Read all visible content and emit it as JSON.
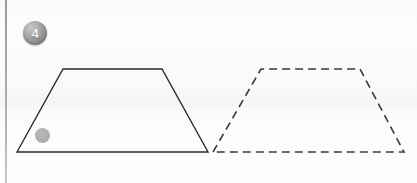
{
  "page": {
    "width": 417,
    "height": 183,
    "background_color": "#fdfdfd",
    "margin_rule_color": "#a9a9a9"
  },
  "question": {
    "number": "4",
    "badge_color": "#8e8e8e",
    "badge_text_color": "#f4f4f4"
  },
  "figure": {
    "stroke_color": "#2b2b2b",
    "stroke_width": 1.4,
    "dash_pattern": "8,5",
    "shapes": [
      {
        "name": "solid-trapezoid",
        "style": "solid",
        "points": "17,152 63,69 162,69 208,152"
      },
      {
        "name": "dashed-trapezoid",
        "style": "dashed",
        "points": "213,152 261,69 360,69 404,152"
      }
    ],
    "marker": {
      "name": "shaded-dot",
      "cx": 42,
      "cy": 135,
      "r": 7,
      "color": "#a9a9a9"
    }
  }
}
